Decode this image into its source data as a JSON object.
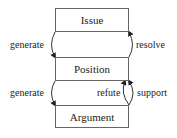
{
  "diagram": {
    "nodes": [
      {
        "id": "issue",
        "label": "Issue"
      },
      {
        "id": "position",
        "label": "Position"
      },
      {
        "id": "argument",
        "label": "Argument"
      }
    ],
    "edges": [
      {
        "from": "issue",
        "to": "position",
        "label": "generate"
      },
      {
        "from": "position",
        "to": "issue",
        "label": "resolve"
      },
      {
        "from": "position",
        "to": "argument",
        "label": "generate"
      },
      {
        "from": "argument",
        "to": "position",
        "label": "refute"
      },
      {
        "from": "argument",
        "to": "position",
        "label": "support"
      }
    ]
  }
}
